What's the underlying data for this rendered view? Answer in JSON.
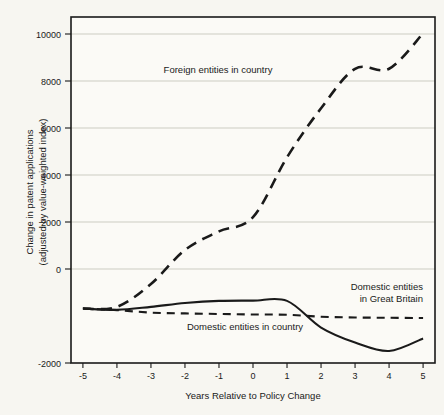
{
  "chart_data": {
    "type": "line",
    "title": "",
    "subtitle": "",
    "xlabel": "Years Relative to Policy Change",
    "ylabel": "Change in patent applications\n(adjusted by value-weighted index)",
    "ylabel_line1": "Change in patent applications",
    "ylabel_line2": "(adjusted by value-weighted index)",
    "x": [
      -5,
      -4,
      -3,
      -2,
      -1,
      0,
      1,
      2,
      3,
      4,
      5
    ],
    "xlim": [
      -5.35,
      5.35
    ],
    "ylim": [
      -2000,
      10700
    ],
    "xticks": [
      -5,
      -4,
      -3,
      -2,
      -1,
      0,
      1,
      2,
      3,
      4,
      5
    ],
    "xtick_labels": [
      "-5",
      "-4",
      "-3",
      "-2",
      "-1",
      "0",
      "1",
      "2",
      "3",
      "4",
      "5"
    ],
    "yticks": [
      -2000,
      0,
      2000,
      4000,
      6000,
      8000,
      10000
    ],
    "ytick_labels": [
      "-2000",
      "0",
      "2000",
      "4000",
      "6000",
      "8000",
      "10000"
    ],
    "grid": "horizontal",
    "legend_position": "inline-annotations",
    "series": [
      {
        "name": "Foreign entities in country",
        "style": "dashed",
        "color": "#1a1a1a",
        "values": [
          0,
          60,
          900,
          2150,
          2830,
          3350,
          5550,
          7350,
          8800,
          8800,
          10100
        ]
      },
      {
        "name": "Domestic entities in country",
        "style": "solid",
        "color": "#1a1a1a",
        "values": [
          0,
          -50,
          60,
          200,
          280,
          290,
          280,
          -700,
          -1250,
          -1560,
          -1100
        ]
      },
      {
        "name": "Domestic entities in Great Britain",
        "style": "dashed",
        "color": "#1a1a1a",
        "values": [
          0,
          -60,
          -150,
          -180,
          -200,
          -220,
          -230,
          -300,
          -330,
          -340,
          -350
        ]
      }
    ],
    "annotations": [
      {
        "text": "Foreign entities in country",
        "x": -1.05,
        "y": 8550
      },
      {
        "text": "Domestic entities in country",
        "x": -0.75,
        "y": -1000
      },
      {
        "text": "Domestic entities",
        "x": 4.05,
        "y": 760
      },
      {
        "text": "in Great Britain",
        "x": 4.3,
        "y": 280
      }
    ]
  },
  "colors": {
    "background": "#f7f6f1",
    "plot_background": "#fbfaf6",
    "axis": "#1a1a1a",
    "grid": "#b9b7ae",
    "series": "#1a1a1a"
  }
}
